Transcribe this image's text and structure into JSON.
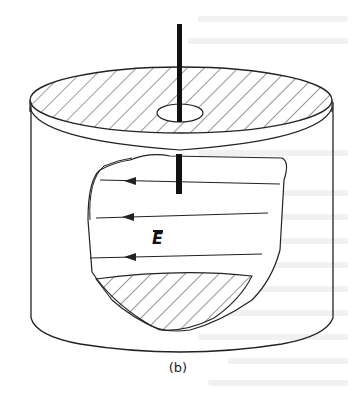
{
  "figure": {
    "caption": "(b)",
    "field_label": "E",
    "field_label_has_overbar": true,
    "colors": {
      "stroke": "#222222",
      "wire": "#111111",
      "background": "#ffffff",
      "bleed_through": "#f1f1f1"
    },
    "field_arrows": [
      {
        "y": 182,
        "direction": "left"
      },
      {
        "y": 217,
        "direction": "left"
      },
      {
        "y": 257,
        "direction": "left"
      }
    ]
  }
}
